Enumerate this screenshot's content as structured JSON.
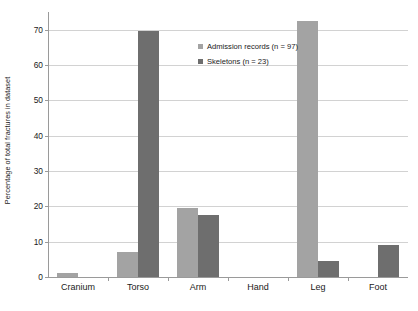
{
  "chart_data": {
    "type": "bar",
    "title": "",
    "subtitle": "",
    "xlabel": "",
    "ylabel": "Percentage of total fractures in dataset",
    "categories": [
      "Cranium",
      "Torso",
      "Arm",
      "Hand",
      "Leg",
      "Foot"
    ],
    "series": [
      {
        "name": "Admission records (n = 97)",
        "color": "#a3a3a3",
        "values": [
          1,
          7,
          19.5,
          0,
          72.5,
          0
        ]
      },
      {
        "name": "Skeletons (n = 23)",
        "color": "#6e6e6e",
        "values": [
          0,
          69.5,
          17.5,
          0,
          4.5,
          9
        ]
      }
    ],
    "ylim": [
      0,
      75
    ],
    "yticks": [
      0,
      10,
      20,
      30,
      40,
      50,
      60,
      70
    ],
    "ytick_labels": [
      "0",
      "10",
      "20",
      "30",
      "40",
      "50",
      "60",
      "70"
    ],
    "grid": true,
    "grid_axis": "y",
    "grid_color": "#d2d2d2",
    "legend_position": "upper center inside",
    "axis_color": "#9a9a9a",
    "background_color": "#ffffff"
  },
  "legend": {
    "entries": [
      {
        "label": "Admission records (n = 97)",
        "swatch": "legend-swatch-admission-records"
      },
      {
        "label": "Skeletons (n = 23)",
        "swatch": "legend-swatch-skeletons"
      }
    ]
  }
}
